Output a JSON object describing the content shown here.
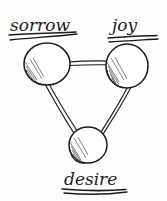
{
  "diagram": {
    "background_color": "#fefefe",
    "ink_color": "#1c1c1c",
    "shading_color": "#555555",
    "nodes": [
      {
        "id": "sorrow",
        "label": "sorrow",
        "label_underlined": true,
        "underline_count": 2,
        "cx": 47,
        "cy": 64,
        "rx": 23,
        "ry": 21,
        "shading": "hatched-lower-left",
        "label_x": 10,
        "label_y": 31
      },
      {
        "id": "joy",
        "label": "joy",
        "label_underlined": true,
        "underline_count": 2,
        "cx": 127,
        "cy": 66,
        "rx": 21,
        "ry": 22,
        "shading": "hatched-lower-left",
        "label_x": 110,
        "label_y": 31
      },
      {
        "id": "desire",
        "label": "desire",
        "label_underlined": true,
        "underline_count": 2,
        "cx": 88,
        "cy": 145,
        "rx": 19,
        "ry": 18,
        "shading": "hatched-lower-left",
        "label_x": 63,
        "label_y": 186
      }
    ],
    "edges": [
      {
        "id": "sorrow-joy",
        "from": "sorrow",
        "to": "joy",
        "style": "double-stroke"
      },
      {
        "id": "sorrow-desire",
        "from": "sorrow",
        "to": "desire",
        "style": "double-stroke"
      },
      {
        "id": "joy-desire",
        "from": "joy",
        "to": "desire",
        "style": "double-stroke"
      }
    ]
  }
}
